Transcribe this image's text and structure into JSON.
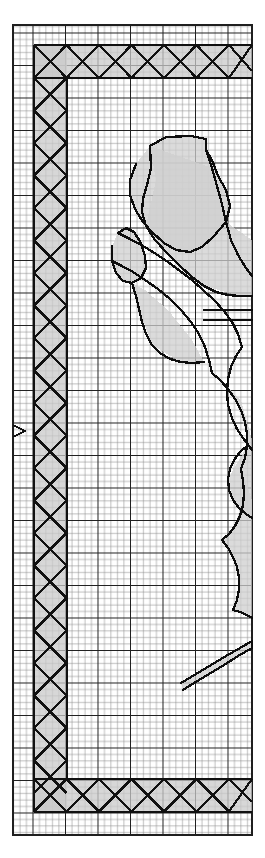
{
  "document": {
    "kind": "survey-plan-sheet",
    "title": "Cadastral survey grid sheet",
    "sheet_width": 265,
    "sheet_height": 858,
    "background_color": "#ffffff"
  },
  "grid": {
    "name": "graph-paper-grid",
    "left": 13,
    "top": 25,
    "right": 252,
    "bottom": 835,
    "minor_cell_px": 6.5,
    "major_every": 5,
    "minor_color": "#8a8a8a",
    "major_color": "#1f1f1f",
    "minor_width": 0.6,
    "major_width": 1.3
  },
  "border_band": {
    "name": "hatched-boundary-band",
    "description": "Heavy L-shaped band of crossed boxes along top, left and bottom edges",
    "band_width_px": 33,
    "cell_px": 32.5,
    "fill_color": "#c9c9c9",
    "stroke_color": "#111111",
    "stroke_width": 2.2,
    "segments": [
      {
        "id": "top-band",
        "x": 34,
        "y": 45,
        "w": 218,
        "h": 33,
        "cells": 7
      },
      {
        "id": "left-band",
        "x": 34,
        "y": 45,
        "w": 33,
        "h": 767,
        "cells": 24
      },
      {
        "id": "bottom-band",
        "x": 34,
        "y": 779,
        "w": 218,
        "h": 33,
        "cells": 7
      }
    ],
    "inner_corner": {
      "x": 67,
      "y": 78
    }
  },
  "markers": [
    {
      "name": "edge-arrow-marker",
      "glyph": "chevron-right",
      "x": 14,
      "y": 431,
      "size": 11,
      "color": "#111111"
    }
  ],
  "parcels": {
    "name": "parcel-polygons",
    "fill_color": "#cfcfcf",
    "fill_opacity": 0.75,
    "stroke_color": "#0d0d0d",
    "stroke_width": 2.3,
    "shapes": [
      {
        "id": "parcel-a",
        "points": "150,146 166,137 191,136 206,139 206,150 212,160 218,176 226,190 230,206 226,222 214,236 202,247 190,252 176,250 164,243 152,232 143,222 135,209 130,195 130,180 136,164"
      },
      {
        "id": "parcel-b",
        "points": "150,146 151,168 147,185 143,199 142,212 146,226 155,240 168,254 180,266 192,277 204,286 216,292 228,295 240,296 252,296"
      },
      {
        "id": "parcel-c",
        "points": "206,150 212,168 217,186 222,204 226,222 231,240 238,255 246,268 252,276"
      },
      {
        "id": "parcel-d",
        "points": "118,233 126,228 134,232 141,243 145,256 146,268 141,278 132,283 123,281 116,273 112,261 112,246"
      },
      {
        "id": "parcel-e",
        "points": "118,233 130,239 143,246 156,254 168,262 180,271 192,280 203,290 214,300 224,311 232,322 238,334 242,347"
      },
      {
        "id": "parcel-f",
        "points": "112,261 122,266 133,272 145,280 158,289 170,299 181,310 191,322 199,334 205,347 209,360 212,373"
      },
      {
        "id": "parcel-g",
        "points": "132,283 136,296 139,309 142,322 146,334 152,345 160,353 170,359 181,362 192,363 204,362"
      },
      {
        "id": "parcel-h",
        "points": "204,310 216,310 228,310 240,310 252,310"
      },
      {
        "id": "parcel-i",
        "points": "204,320 216,320 228,320 240,320 252,320"
      },
      {
        "id": "parcel-j",
        "points": "242,347 236,356 231,367 228,379 227,392 228,405 232,418 237,429 243,438 249,446 252,450"
      },
      {
        "id": "parcel-k",
        "points": "212,373 220,380 228,389 235,399 241,410 245,422 247,434 247,446 245,458 241,469"
      },
      {
        "id": "parcel-l",
        "points": "247,446 240,452 234,460 230,469 228,479 229,490 233,500 239,508 246,514 252,518"
      },
      {
        "id": "parcel-m",
        "points": "241,469 243,481 244,493 243,505 240,516 235,526 229,534 222,540"
      },
      {
        "id": "parcel-n",
        "points": "222,540 228,548 233,557 237,567 239,578 239,589 237,600 233,610"
      },
      {
        "id": "parcel-o",
        "points": "233,610 240,612 247,615 252,618"
      },
      {
        "id": "parcel-sliver",
        "points": "181,683 196,674 211,665 226,656 240,648 252,641 252,648 238,656 224,665 209,674 194,683 183,690"
      }
    ]
  },
  "legend": {
    "hatched_band_meaning": "boundary / reserved strip",
    "gray_polygon_meaning": "parcel area"
  }
}
